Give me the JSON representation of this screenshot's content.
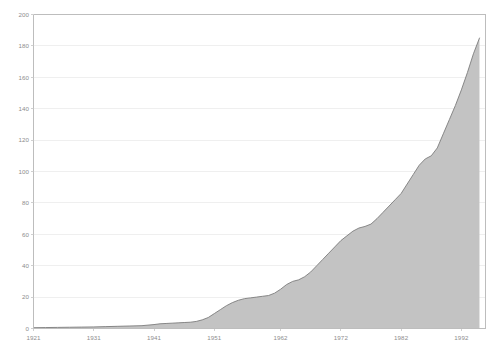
{
  "chart_data": {
    "type": "area",
    "title": "",
    "subtitle": "",
    "xlabel": "",
    "ylabel": "",
    "xlim": [
      1921,
      1996
    ],
    "ylim": [
      0,
      200
    ],
    "grid": true,
    "legend": null,
    "colors": {
      "fill": "#c3c3c3",
      "line": "#7d7d7d",
      "grid": "#e8e8e8",
      "axis": "#bdbdbd",
      "text": "#8d8d8d"
    },
    "y_ticks": [
      0,
      20,
      40,
      60,
      80,
      100,
      120,
      140,
      160,
      180,
      200
    ],
    "y_tick_labels": [
      "0",
      "20",
      "40",
      "60",
      "80",
      "100",
      "120",
      "140",
      "160",
      "180",
      "200"
    ],
    "x_ticks": [
      1921,
      1931,
      1941,
      1951,
      1962,
      1972,
      1982,
      1992
    ],
    "x_tick_labels": [
      "1921",
      "1931",
      "1941",
      "1951",
      "1962",
      "1972",
      "1982",
      "1992"
    ],
    "series": [
      {
        "name": "cumulative",
        "x": [
          1921,
          1923,
          1925,
          1927,
          1929,
          1931,
          1933,
          1935,
          1937,
          1939,
          1941,
          1942,
          1943,
          1944,
          1945,
          1946,
          1947,
          1948,
          1949,
          1950,
          1951,
          1952,
          1953,
          1954,
          1955,
          1956,
          1957,
          1958,
          1959,
          1960,
          1961,
          1962,
          1963,
          1964,
          1965,
          1966,
          1967,
          1968,
          1969,
          1970,
          1971,
          1972,
          1973,
          1974,
          1975,
          1976,
          1977,
          1978,
          1979,
          1980,
          1981,
          1982,
          1983,
          1984,
          1985,
          1986,
          1987,
          1988,
          1989,
          1990,
          1991,
          1992,
          1993,
          1994,
          1995
        ],
        "values": [
          0.5,
          0.6,
          0.7,
          0.8,
          0.9,
          1.0,
          1.2,
          1.4,
          1.6,
          1.8,
          2.5,
          3.0,
          3.2,
          3.4,
          3.6,
          3.8,
          4.0,
          4.5,
          5.5,
          7.0,
          9.5,
          12.0,
          14.5,
          16.5,
          18.0,
          19.0,
          19.5,
          20.0,
          20.5,
          21.0,
          22.5,
          25.0,
          28.0,
          30.0,
          31.0,
          33.0,
          36.0,
          40.0,
          44.0,
          48.0,
          52.0,
          56.0,
          59.0,
          62.0,
          64.0,
          65.0,
          66.5,
          70.0,
          74.0,
          78.0,
          82.0,
          86.0,
          92.0,
          98.0,
          104.0,
          108.0,
          110.0,
          115.0,
          124.0,
          133.0,
          142.0,
          152.0,
          163.0,
          175.0,
          185.0
        ]
      }
    ]
  }
}
